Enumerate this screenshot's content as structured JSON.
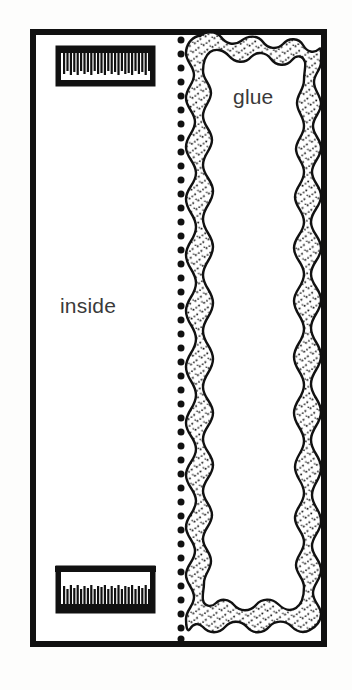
{
  "figure": {
    "type": "line-drawing-diagram",
    "background_color": "#fdfdfc",
    "ink_color": "#111111"
  },
  "labels": {
    "inside": "inside",
    "glue": "glue"
  },
  "panels": [
    {
      "name": "inside-panel",
      "label": "inside",
      "x": 30,
      "y": 29,
      "width": 150,
      "height": 618
    },
    {
      "name": "glue-panel",
      "label": "glue",
      "x": 180,
      "y": 29,
      "width": 147,
      "height": 618
    }
  ],
  "outer_border": {
    "name": "outer-border",
    "x": 30,
    "y": 29,
    "width": 297,
    "height": 618,
    "stroke_width": 6,
    "color": "#111111"
  },
  "fold_line": {
    "name": "dotted-fold-line",
    "style": "dotted",
    "x": 181,
    "y_start": 36,
    "y_end": 641,
    "dot_radius": 3.4,
    "dot_spacing": 14,
    "dot_count": 44,
    "color": "#111111"
  },
  "glue_ring": {
    "name": "glue-band",
    "style": "wavy-stippled-band",
    "fill": "stipple",
    "stroke_color": "#111111",
    "stipple_color": "#111111",
    "outer_x": 186,
    "outer_y": 35,
    "outer_width": 135,
    "outer_height": 606
  },
  "brushes": [
    {
      "name": "comb-top",
      "orientation": "teeth-down",
      "x": 56,
      "y": 46,
      "width": 99,
      "height": 40,
      "tooth_count": 27
    },
    {
      "name": "comb-bottom",
      "orientation": "teeth-down",
      "x": 56,
      "y": 566,
      "width": 99,
      "height": 48,
      "tooth_count": 27
    }
  ]
}
